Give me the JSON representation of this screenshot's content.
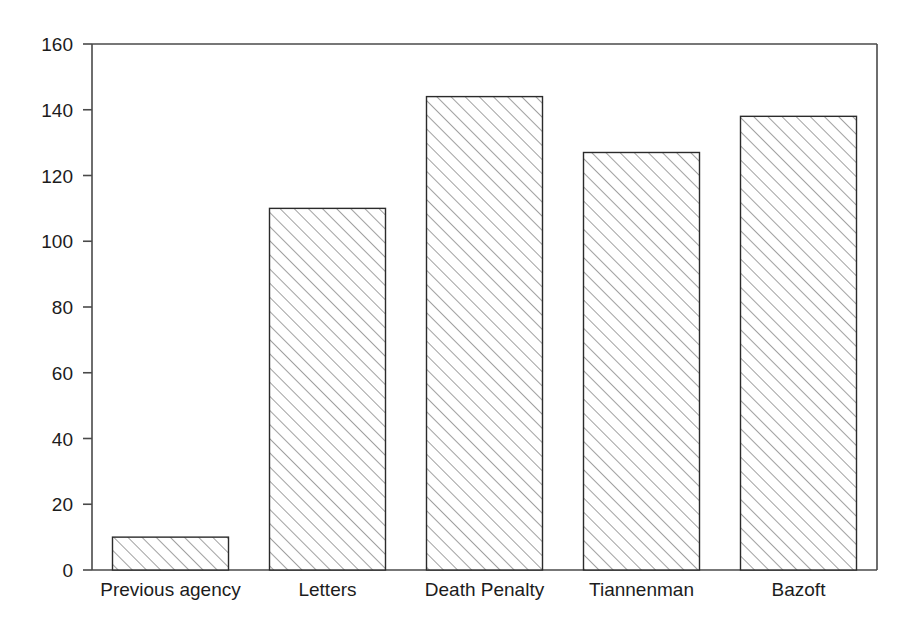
{
  "chart_data": {
    "type": "bar",
    "title": "",
    "subtitle": "",
    "xlabel": "",
    "ylabel": "",
    "categories": [
      "Previous agency",
      "Letters",
      "Death Penalty",
      "Tiannenman",
      "Bazoft"
    ],
    "values": [
      10,
      110,
      144,
      127,
      138
    ],
    "ylim": [
      0,
      160
    ],
    "ytick_labels": [
      "0",
      "20",
      "40",
      "60",
      "80",
      "100",
      "120",
      "140",
      "160"
    ],
    "ytick_values": [
      0,
      20,
      40,
      60,
      80,
      100,
      120,
      140,
      160
    ],
    "grid": false,
    "legend": null,
    "annotations": [],
    "style": {
      "bar_fill": "#ffffff",
      "bar_edge": "#2b2b2b",
      "hatch": "diagonal-forward-slash",
      "axis_color": "#4a4a4a",
      "text_color": "#1c1c1c",
      "background": "#ffffff"
    }
  }
}
